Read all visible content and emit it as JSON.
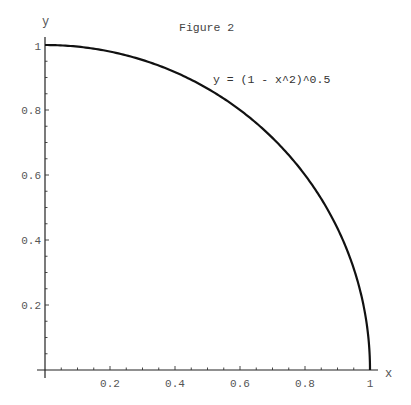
{
  "chart_data": {
    "type": "line",
    "title": "Figure 2",
    "xlabel": "x",
    "ylabel": "y",
    "xlim": [
      0,
      1
    ],
    "ylim": [
      0,
      1
    ],
    "grid": false,
    "legend": null,
    "x_ticks": [
      0.2,
      0.4,
      0.6,
      0.8,
      1
    ],
    "x_tick_labels": [
      "0.2",
      "0.4",
      "0.6",
      "0.8",
      "1"
    ],
    "y_ticks": [
      0.2,
      0.4,
      0.6,
      0.8,
      1
    ],
    "y_tick_labels": [
      "0.2",
      "0.4",
      "0.6",
      "0.8",
      "1"
    ],
    "minor_tick_step": 0.05,
    "annotations": [
      {
        "text": "y = (1 - x^2)^0.5",
        "x": 0.52,
        "y": 0.905
      }
    ],
    "series": [
      {
        "name": "y = (1 - x^2)^0.5",
        "x": [
          0,
          0.1,
          0.2,
          0.3,
          0.4,
          0.5,
          0.6,
          0.7,
          0.8,
          0.9,
          0.95,
          0.99,
          1.0
        ],
        "values": [
          1.0,
          0.995,
          0.98,
          0.954,
          0.917,
          0.866,
          0.8,
          0.714,
          0.6,
          0.436,
          0.312,
          0.141,
          0.0
        ],
        "color": "#111111"
      }
    ]
  },
  "labels": {
    "title": "Figure 2",
    "x_axis": "x",
    "y_axis": "y",
    "annotation": "y = (1 - x^2)^0.5",
    "x_ticks": [
      "0.2",
      "0.4",
      "0.6",
      "0.8",
      "1"
    ],
    "y_ticks": [
      "0.2",
      "0.4",
      "0.6",
      "0.8",
      "1"
    ]
  },
  "colors": {
    "curve": "#111111",
    "axis": "#222222",
    "text": "#555555",
    "background": "#ffffff"
  }
}
